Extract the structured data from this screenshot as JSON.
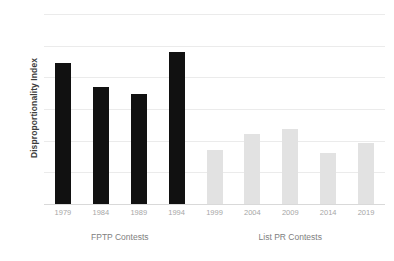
{
  "chart_data": {
    "type": "bar",
    "title": "",
    "xlabel": "",
    "ylabel": "Disproportionality Index",
    "ylim": [
      0,
      30
    ],
    "ytick_values": [
      0,
      5,
      10,
      15,
      20,
      25,
      30
    ],
    "ytick_labels": [
      "0",
      "5",
      "10",
      "15",
      "20",
      "25",
      "30"
    ],
    "grid": true,
    "legend": "none",
    "categories": [
      "1979",
      "1984",
      "1989",
      "1994",
      "1999",
      "2004",
      "2009",
      "2014",
      "2019"
    ],
    "values": [
      22.2,
      18.5,
      17.4,
      24.0,
      8.6,
      11.0,
      11.8,
      8.1,
      9.6
    ],
    "bar_colors": [
      "#111111",
      "#111111",
      "#111111",
      "#111111",
      "#e2e2e2",
      "#e2e2e2",
      "#e2e2e2",
      "#e2e2e2",
      "#e2e2e2"
    ],
    "groups": [
      {
        "label": "FPTP Contests",
        "categories": [
          "1979",
          "1984",
          "1989",
          "1994"
        ]
      },
      {
        "label": "List PR Contests",
        "categories": [
          "1999",
          "2004",
          "2009",
          "2014",
          "2019"
        ]
      }
    ]
  },
  "colors": {
    "fptp_bar": "#111111",
    "listpr_bar": "#e2e2e2",
    "gridline": "#ebebeb",
    "baseline": "#d9d9d9",
    "tick_text": "#a6a6a6",
    "group_text": "#808080",
    "axis_title_text": "#3d3d3d",
    "background": "#ffffff"
  }
}
